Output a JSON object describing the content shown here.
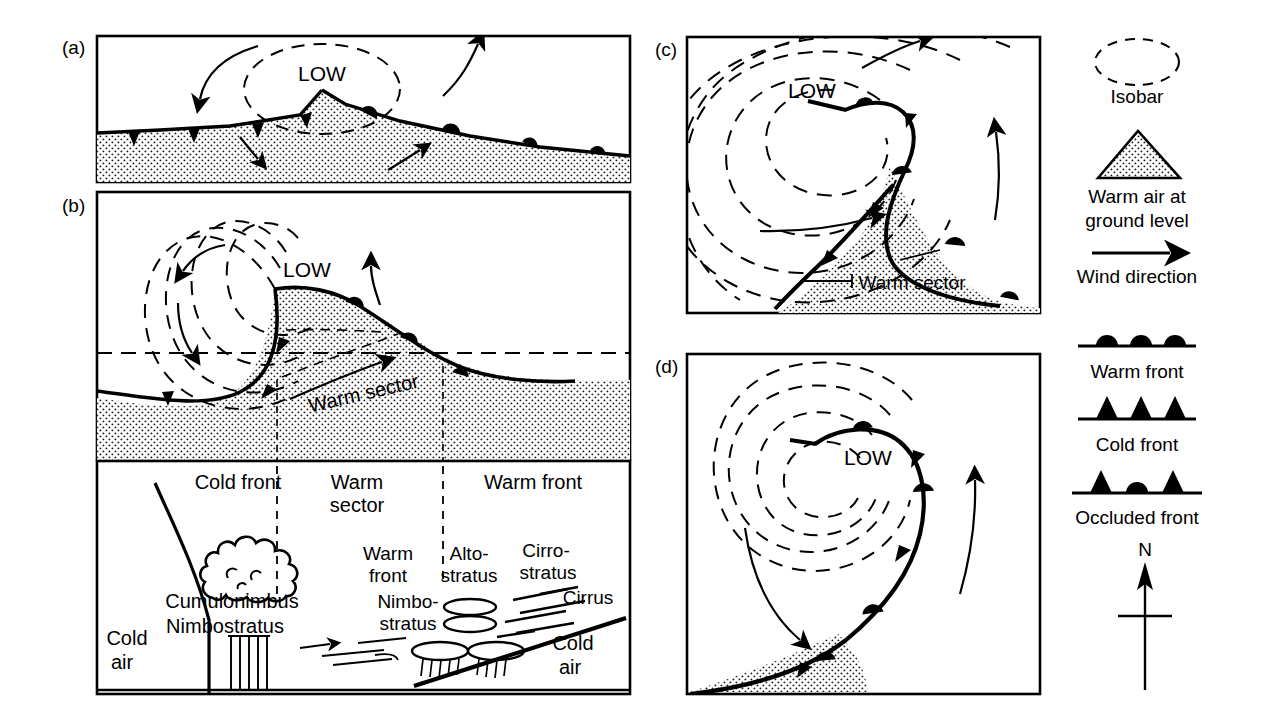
{
  "figure": {
    "background": "#ffffff",
    "ink": "#000000",
    "stipple": "#f2f2f2"
  },
  "panels": [
    {
      "id": "a",
      "letter": "(a)",
      "stage": "Frontal wave forming on stationary front",
      "low_label": "LOW",
      "isobars": 1,
      "fronts": [
        "cold front",
        "warm front"
      ],
      "wind_arrows": 4
    },
    {
      "id": "b",
      "letter": "(b)",
      "stage": "Mature depression with open warm sector",
      "low_label": "LOW",
      "warm_sector_label": "Warm sector",
      "isobars": 4,
      "fronts": [
        "cold front",
        "warm front"
      ],
      "wind_arrows": 4,
      "cross_section_line": true
    },
    {
      "id": "c",
      "letter": "(c)",
      "stage": "Occlusion beginning",
      "low_label": "LOW",
      "warm_sector_label": "Warm sector",
      "isobars": 5,
      "fronts": [
        "occluded front",
        "cold front",
        "warm front"
      ],
      "wind_arrows": 3
    },
    {
      "id": "d",
      "letter": "(d)",
      "stage": "Fully occluded depression",
      "low_label": "LOW",
      "isobars": 5,
      "fronts": [
        "occluded front",
        "cold front",
        "warm front"
      ],
      "wind_arrows": 2
    }
  ],
  "cross_section": {
    "top_labels": [
      "Cold front",
      "Warm sector",
      "Warm front"
    ],
    "cloud_labels": [
      "Cumulonimbus",
      "Nimbostratus",
      "Warm front",
      "Nimbo-stratus",
      "Alto-stratus",
      "Cirro-stratus",
      "Cirrus"
    ],
    "labels": {
      "cold_front": "Cold front",
      "warm_sector_line1": "Warm",
      "warm_sector_line2": "sector",
      "warm_front_top": "Warm front",
      "cumulonimbus": "Cumulonimbus",
      "nimbostratus": "Nimbostratus",
      "warm_front_l1": "Warm",
      "warm_front_l2": "front",
      "nimbo_l1": "Nimbo-",
      "nimbo_l2": "stratus",
      "alto_l1": "Alto-",
      "alto_l2": "stratus",
      "cirro_l1": "Cirro-",
      "cirro_l2": "stratus",
      "cirrus": "Cirrus",
      "cold_air_left_l1": "Cold",
      "cold_air_left_l2": "air",
      "cold_air_right_l1": "Cold",
      "cold_air_right_l2": "air"
    }
  },
  "legend": {
    "items": [
      {
        "key": "isobar",
        "label": "Isobar",
        "symbol": "dashed-ellipse"
      },
      {
        "key": "warm-air",
        "label": "Warm air at",
        "label2": "ground level",
        "symbol": "stippled-triangle"
      },
      {
        "key": "wind",
        "label": "Wind direction",
        "symbol": "arrow-right"
      },
      {
        "key": "warm-front",
        "label": "Warm front",
        "symbol": "line-with-semicircles"
      },
      {
        "key": "cold-front",
        "label": "Cold front",
        "symbol": "line-with-triangles"
      },
      {
        "key": "occluded-front",
        "label": "Occluded front",
        "symbol": "line-with-triangles-and-semicircles"
      }
    ],
    "north": {
      "label": "N",
      "symbol": "north-arrow"
    }
  }
}
